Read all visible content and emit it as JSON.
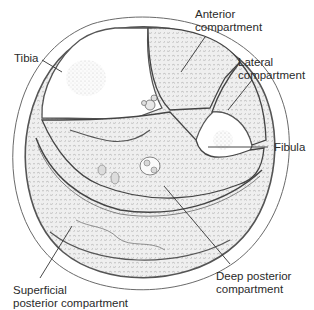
{
  "diagram": {
    "labels": {
      "tibia": "Tibia",
      "anterior_line1": "Anterior",
      "anterior_line2": "compartment",
      "lateral_line1": "Lateral",
      "lateral_line2": "compartment",
      "fibula": "Fibula",
      "deep_line1": "Deep posterior",
      "deep_line2": "compartment",
      "superficial_line1": "Superficial",
      "superficial_line2": "posterior compartment"
    },
    "colors": {
      "outline": "#5a5a5a",
      "skin_fill": "#ffffff",
      "muscle_fill": "#eeeeee",
      "bone_fill": "#ffffff",
      "text": "#2a2a2a"
    }
  }
}
